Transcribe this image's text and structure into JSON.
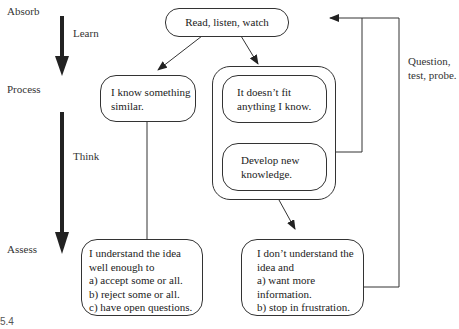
{
  "stages": {
    "absorb": "Absorb",
    "process": "Process",
    "assess": "Assess"
  },
  "arrows": {
    "learn": "Learn",
    "think": "Think"
  },
  "nodes": {
    "read": "Read, listen, watch",
    "similar": [
      "I know something",
      "similar."
    ],
    "nofit": [
      "It doesn’t fit",
      "anything I know."
    ],
    "develop": [
      "Develop new",
      "knowledge."
    ],
    "understand": [
      "I understand the idea",
      "well enough to",
      "a) accept some or all.",
      "b) reject some or all.",
      "c) have open questions."
    ],
    "dont_understand": [
      "I don’t understand the",
      "idea and",
      "a) want more",
      "information.",
      "b) stop in frustration."
    ]
  },
  "feedback_label": [
    "Question,",
    "test, probe."
  ],
  "figure_caption": "5.4"
}
